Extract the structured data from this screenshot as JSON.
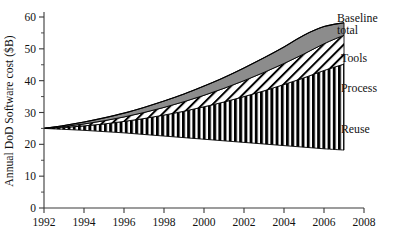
{
  "chart_data": {
    "type": "area",
    "title": "",
    "xlabel": "",
    "ylabel": "Annual DoD Software cost ($B)",
    "xlim": [
      1992,
      2008
    ],
    "ylim": [
      0,
      60
    ],
    "grid": false,
    "legend_position": "right-callout",
    "x_ticks": [
      "1992",
      "1994",
      "1996",
      "1998",
      "2000",
      "2002",
      "2004",
      "2006",
      "2008"
    ],
    "x_tick_values": [
      1992,
      1994,
      1996,
      1998,
      2000,
      2002,
      2004,
      2006,
      2008
    ],
    "y_ticks": [
      "0",
      "10",
      "20",
      "30",
      "40",
      "50",
      "60"
    ],
    "y_tick_values": [
      0,
      10,
      20,
      30,
      40,
      50,
      60
    ],
    "y_minor_tick_values": [
      5,
      15,
      25,
      35,
      45,
      55
    ],
    "x": [
      1992,
      1993,
      1994,
      1995,
      1996,
      1997,
      1998,
      1999,
      2000,
      2001,
      2002,
      2003,
      2004,
      2005,
      2006,
      2007
    ],
    "series": [
      {
        "name": "Reuse",
        "label": "Reuse",
        "fill": "vertical-stripes",
        "values": [
          25,
          24.7,
          24.4,
          24.0,
          23.6,
          23.1,
          22.6,
          22.1,
          21.6,
          21.1,
          20.6,
          20.1,
          19.6,
          19.1,
          18.6,
          18.2
        ]
      },
      {
        "name": "Process",
        "label": "Process",
        "fill": "diagonal-hatch",
        "values": [
          25,
          25.3,
          25.8,
          26.4,
          27.2,
          28.1,
          29.2,
          30.4,
          31.8,
          33.3,
          35.0,
          36.8,
          38.8,
          40.9,
          43.2,
          45.2
        ]
      },
      {
        "name": "Tools",
        "label": "Tools",
        "fill": "solid-gray",
        "values": [
          25,
          25.6,
          26.4,
          27.4,
          28.6,
          30.0,
          31.6,
          33.4,
          35.4,
          37.6,
          40.0,
          42.6,
          45.4,
          48.4,
          51.6,
          54.3
        ]
      },
      {
        "name": "Baseline total",
        "label": "Baseline total",
        "fill": "none",
        "values": [
          25,
          25.9,
          27.0,
          28.3,
          29.8,
          31.6,
          33.6,
          35.8,
          38.3,
          41.0,
          44.0,
          47.2,
          50.6,
          54.3,
          57.0,
          58.2
        ]
      }
    ],
    "annotations": [
      {
        "text": "Baseline total",
        "target": "upper-envelope"
      },
      {
        "text": "Tools",
        "target": "tools-band"
      },
      {
        "text": "Process",
        "target": "process-band"
      },
      {
        "text": "Reuse",
        "target": "reuse-band"
      }
    ],
    "colors": {
      "tools_fill": "#8c8c8c",
      "hatch_stroke": "#000000",
      "stripe_fill": "#000000",
      "axis": "#3a3a3a",
      "text": "#111111",
      "background": "#ffffff"
    }
  },
  "callouts": {
    "baseline_line1": "Baseline",
    "baseline_line2": "total",
    "tools": "Tools",
    "process": "Process",
    "reuse": "Reuse"
  },
  "axis": {
    "y_title": "Annual DoD Software cost ($B)"
  }
}
